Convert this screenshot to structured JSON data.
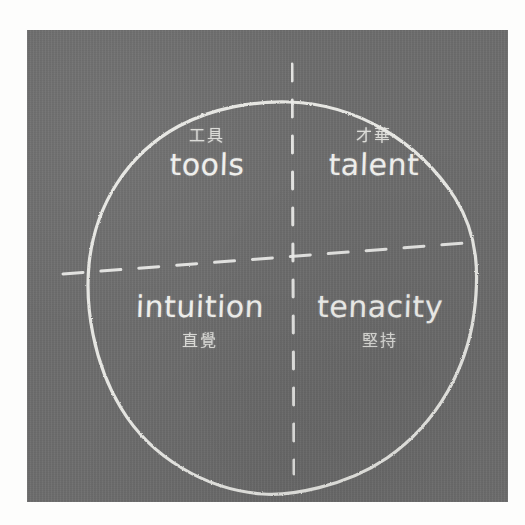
{
  "diagram": {
    "type": "2x2-quadrant-circle",
    "medium": "chalkboard",
    "title": "",
    "board_color": "#6d6d6d",
    "chalk_color": "#efefec",
    "page_background": "#fdfdfc",
    "circle": {
      "style": "hand-drawn solid chalk outline",
      "center_x": 260,
      "center_y": 268,
      "radius_x": 185,
      "radius_y": 196
    },
    "axes": {
      "style": "dashed chalk",
      "vertical_label": "",
      "horizontal_label": "",
      "vertical_x": 265,
      "horizontal_y": 268
    },
    "quadrants": [
      {
        "id": "top-left",
        "position": "top-left",
        "chinese": "工具",
        "english": "tools",
        "order": "chinese-above-english"
      },
      {
        "id": "top-right",
        "position": "top-right",
        "chinese": "才華",
        "english": "talent",
        "order": "chinese-above-english"
      },
      {
        "id": "bottom-left",
        "position": "bottom-left",
        "chinese": "直覺",
        "english": "intuition",
        "order": "english-above-chinese"
      },
      {
        "id": "bottom-right",
        "position": "bottom-right",
        "chinese": "堅持",
        "english": "tenacity",
        "order": "english-above-chinese"
      }
    ]
  }
}
